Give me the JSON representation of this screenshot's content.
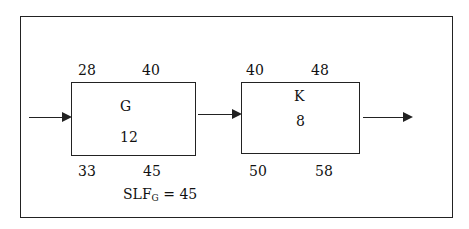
{
  "activities": [
    {
      "name": "G",
      "duration": "12",
      "es": "28",
      "ef": "40",
      "ls": "33",
      "lf": "45"
    },
    {
      "name": "K",
      "duration": "8",
      "es": "40",
      "ef": "48",
      "ls": "50",
      "lf": "58"
    }
  ],
  "slack": {
    "label": "SLF",
    "subscript": "G",
    "value": "= 45"
  }
}
